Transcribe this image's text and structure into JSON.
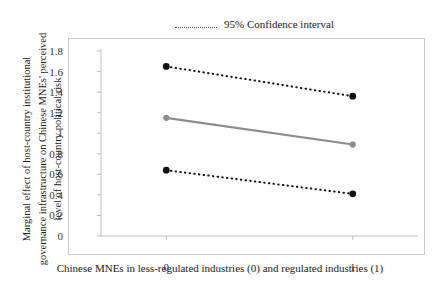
{
  "chart_data": {
    "type": "line",
    "title": "",
    "subtitle": "",
    "xlabel": "Chinese MNEs in less-regulated industries (0) and regulated industries (1)",
    "ylabel": "Marginal effect of host-country institutional governance infrastructure on Chinese MNEs' perceived level of host-country political risk",
    "ylabel_lines": [
      "Marginal effect of host-country institutional",
      "governance infrastructure on Chinese MNEs' perceived",
      "level of host-country political risk"
    ],
    "categories": [
      "0",
      "1"
    ],
    "x": [
      0,
      1
    ],
    "xlim": [
      -0.35,
      1.35
    ],
    "ylim": [
      0,
      1.8
    ],
    "yticks": [
      "0",
      "0.2",
      "0.4",
      "0.6",
      "0.8",
      "1",
      "1.2",
      "1.4",
      "1.6",
      "1.8"
    ],
    "ytick_values": [
      0,
      0.2,
      0.4,
      0.6,
      0.8,
      1.0,
      1.2,
      1.4,
      1.6,
      1.8
    ],
    "grid": false,
    "legend_position": "top-center",
    "series": [
      {
        "name": "Upper 95% confidence bound",
        "values": [
          1.65,
          1.36
        ],
        "style": "dotted",
        "color": "#111111",
        "marker": "circle"
      },
      {
        "name": "Marginal effect",
        "values": [
          1.15,
          0.89
        ],
        "style": "solid",
        "color": "#8c8c8c",
        "marker": "circle"
      },
      {
        "name": "Lower 95% confidence bound",
        "values": [
          0.64,
          0.41
        ],
        "style": "dotted",
        "color": "#111111",
        "marker": "circle"
      }
    ]
  },
  "legend": {
    "items": [
      {
        "label": "95% Confidence interval",
        "style": "dotted",
        "color": "#4d4d4d"
      }
    ]
  },
  "axis": {
    "y_title_line1": "Marginal effect of host-country institutional",
    "y_title_line2": "governance infrastructure on Chinese MNEs' perceived",
    "y_title_line3": "level of host-country political risk",
    "x_caption": "Chinese MNEs in less-regulated industries (0) and regulated industries (1)",
    "axis_color": "#bfbfbf",
    "frame_color": "#c9c9c9"
  }
}
